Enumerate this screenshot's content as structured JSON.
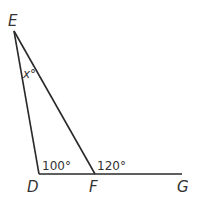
{
  "diagram": {
    "points": {
      "E": {
        "label": "E"
      },
      "D": {
        "label": "D"
      },
      "F": {
        "label": "F"
      },
      "G": {
        "label": "G"
      }
    },
    "segments": [
      "ED",
      "EF",
      "DG"
    ],
    "angles": {
      "E": {
        "label": "x°"
      },
      "D": {
        "label": "100°"
      },
      "F_exterior": {
        "label": "120°"
      }
    }
  }
}
